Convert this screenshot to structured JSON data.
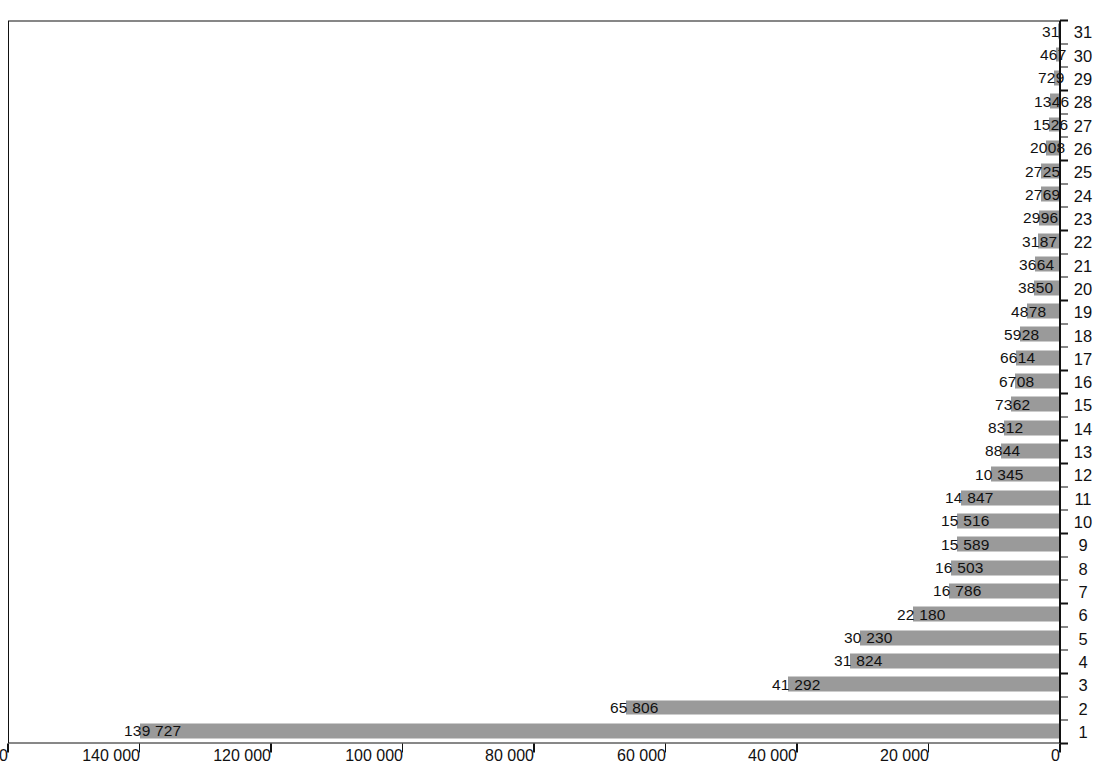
{
  "chart_data": {
    "type": "bar",
    "title": "",
    "subtitle": "",
    "xlabel": "",
    "ylabel": "",
    "orientation": "vertical-rotated-90ccw",
    "grid": false,
    "legend": null,
    "bar_color": "#9a9a9a",
    "axis_color": "#111111",
    "ylim": [
      0,
      160000
    ],
    "yticks": [
      0,
      20000,
      40000,
      60000,
      80000,
      100000,
      120000,
      140000,
      160000
    ],
    "ytick_labels": [
      "0",
      "20 000",
      "40 000",
      "60 000",
      "80 000",
      "100 000",
      "120 000",
      "140 000",
      "160 000"
    ],
    "ranks": [
      "1",
      "2",
      "3",
      "4",
      "5",
      "6",
      "7",
      "8",
      "9",
      "10",
      "11",
      "12",
      "13",
      "14",
      "15",
      "16",
      "17",
      "18",
      "19",
      "20",
      "21",
      "22",
      "23",
      "24",
      "25",
      "26",
      "27",
      "28",
      "29",
      "30",
      "31"
    ],
    "categories": [
      "广东",
      "江苏",
      "浙江",
      "山东",
      "安徽",
      "湖北",
      "上海",
      "湖南",
      "北京",
      "福建",
      "四川",
      "河南",
      "河北",
      "江西",
      "重庆",
      "陕西",
      "辽宁",
      "天津",
      "广西",
      "贵州",
      "山西",
      "吉林",
      "云南",
      "黑龙江",
      "内蒙古",
      "新疆",
      "甘肃",
      "宁夏",
      "海南",
      "青海",
      "西藏"
    ],
    "category_chars": [
      [
        "广",
        "东"
      ],
      [
        "江",
        "苏"
      ],
      [
        "浙",
        "江"
      ],
      [
        "山",
        "东"
      ],
      [
        "安",
        "徽"
      ],
      [
        "湖",
        "北"
      ],
      [
        "上",
        "海"
      ],
      [
        "湖",
        "南"
      ],
      [
        "北",
        "京"
      ],
      [
        "福",
        "建"
      ],
      [
        "四",
        "川"
      ],
      [
        "河",
        "南"
      ],
      [
        "河",
        "北"
      ],
      [
        "江",
        "西"
      ],
      [
        "重",
        "庆"
      ],
      [
        "陕",
        "西"
      ],
      [
        "辽",
        "宁"
      ],
      [
        "天",
        "津"
      ],
      [
        "广",
        "西"
      ],
      [
        "贵",
        "州"
      ],
      [
        "山",
        "西"
      ],
      [
        "吉",
        "林"
      ],
      [
        "云",
        "南"
      ],
      [
        "黑龙",
        "江"
      ],
      [
        "内蒙",
        "古"
      ],
      [
        "新",
        "疆"
      ],
      [
        "甘",
        "肃"
      ],
      [
        "宁",
        "夏"
      ],
      [
        "海",
        "南"
      ],
      [
        "青",
        "海"
      ],
      [
        "西",
        "藏"
      ]
    ],
    "values": [
      139727,
      65806,
      41292,
      31824,
      30230,
      22180,
      16786,
      16503,
      15589,
      15516,
      14847,
      10345,
      8844,
      8312,
      7362,
      6708,
      6614,
      5928,
      4878,
      3850,
      3664,
      3187,
      2996,
      2769,
      2725,
      2008,
      1526,
      1346,
      729,
      467,
      31
    ],
    "value_labels": [
      "139 727",
      "65 806",
      "41 292",
      "31 824",
      "30 230",
      "22 180",
      "16 786",
      "16 503",
      "15 589",
      "15 516",
      "14 847",
      "10 345",
      "8844",
      "8312",
      "7362",
      "6708",
      "6614",
      "5928",
      "4878",
      "3850",
      "3664",
      "3187",
      "2996",
      "2769",
      "2725",
      "2008",
      "1526",
      "1346",
      "729",
      "467",
      "31"
    ]
  }
}
